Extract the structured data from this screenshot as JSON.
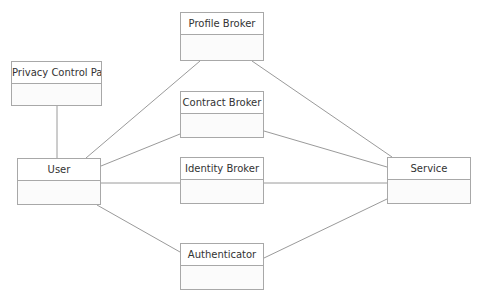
{
  "diagram": {
    "nodes": [
      {
        "id": "profile",
        "label": "Profile Broker",
        "x": 180,
        "y": 12,
        "w": 84,
        "h": 49
      },
      {
        "id": "privacy",
        "label": "Privacy Control Panel",
        "x": 11,
        "y": 61,
        "w": 91,
        "h": 45
      },
      {
        "id": "contract",
        "label": "Contract Broker",
        "x": 180,
        "y": 91,
        "w": 84,
        "h": 47
      },
      {
        "id": "user",
        "label": "User",
        "x": 17,
        "y": 158,
        "w": 84,
        "h": 47
      },
      {
        "id": "identity",
        "label": "Identity Broker",
        "x": 180,
        "y": 157,
        "w": 84,
        "h": 47
      },
      {
        "id": "service",
        "label": "Service",
        "x": 387,
        "y": 157,
        "w": 84,
        "h": 47
      },
      {
        "id": "auth",
        "label": "Authenticator",
        "x": 180,
        "y": 243,
        "w": 84,
        "h": 47
      }
    ],
    "edges": [
      {
        "from": "privacy",
        "to": "user",
        "x1": 57,
        "y1": 106,
        "x2": 57,
        "y2": 158
      },
      {
        "from": "user",
        "to": "profile",
        "x1": 86,
        "y1": 158,
        "x2": 200,
        "y2": 61
      },
      {
        "from": "user",
        "to": "contract",
        "x1": 101,
        "y1": 166,
        "x2": 180,
        "y2": 134
      },
      {
        "from": "user",
        "to": "identity",
        "x1": 101,
        "y1": 183,
        "x2": 180,
        "y2": 183
      },
      {
        "from": "user",
        "to": "auth",
        "x1": 97,
        "y1": 205,
        "x2": 180,
        "y2": 252
      },
      {
        "from": "profile",
        "to": "service",
        "x1": 252,
        "y1": 61,
        "x2": 392,
        "y2": 157
      },
      {
        "from": "contract",
        "to": "service",
        "x1": 264,
        "y1": 131,
        "x2": 387,
        "y2": 167
      },
      {
        "from": "identity",
        "to": "service",
        "x1": 264,
        "y1": 183,
        "x2": 387,
        "y2": 183
      },
      {
        "from": "auth",
        "to": "service",
        "x1": 264,
        "y1": 258,
        "x2": 387,
        "y2": 199
      }
    ],
    "colors": {
      "line": "#9a9a9a",
      "border": "#a8a8a8",
      "text": "#333333"
    }
  }
}
